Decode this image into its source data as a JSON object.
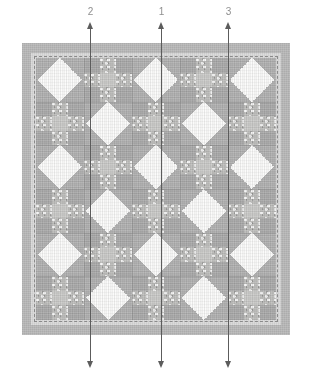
{
  "diagram": {
    "type": "quilt-layout",
    "canvas": {
      "width": 313,
      "height": 371
    }
  },
  "colors": {
    "outer_border": "#b5b5b5",
    "inner_band": "#d7d7d7",
    "field_background": "#f4f4f2",
    "patch_dark": "#a9a9a9",
    "patch_medium": "#c9c9c7",
    "patch_light": "#f6f6f4",
    "patch_texture": "#bdbdbb",
    "arrow": "#5c5c5c",
    "label_text": "#8f8f8f",
    "stitch_line": "#8a8a8a"
  },
  "quilt": {
    "outer_border_label": "outer border",
    "inner_band_label": "inner border",
    "stitch_line_label": "basting stitch line",
    "field_label": "pieced center",
    "grid": {
      "columns": 5,
      "rows": 6
    },
    "block_types": [
      "snowball",
      "nine-patch"
    ],
    "blocks": [
      [
        "snowball",
        "nine-patch",
        "snowball",
        "nine-patch",
        "snowball"
      ],
      [
        "nine-patch",
        "snowball",
        "nine-patch",
        "snowball",
        "nine-patch"
      ],
      [
        "snowball",
        "nine-patch",
        "snowball",
        "nine-patch",
        "snowball"
      ],
      [
        "nine-patch",
        "snowball",
        "nine-patch",
        "snowball",
        "nine-patch"
      ],
      [
        "snowball",
        "nine-patch",
        "snowball",
        "nine-patch",
        "snowball"
      ],
      [
        "nine-patch",
        "snowball",
        "nine-patch",
        "snowball",
        "nine-patch"
      ]
    ],
    "nine_patch_layout": [
      [
        "dark",
        "texture",
        "dark"
      ],
      [
        "texture",
        "medium",
        "texture"
      ],
      [
        "dark",
        "texture",
        "dark"
      ]
    ]
  },
  "arrows": [
    {
      "id": "arrow-2",
      "label": "2",
      "x": 90,
      "top_y": 28,
      "bottom_y": 362
    },
    {
      "id": "arrow-1",
      "label": "1",
      "x": 161,
      "top_y": 28,
      "bottom_y": 362
    },
    {
      "id": "arrow-3",
      "label": "3",
      "x": 228,
      "top_y": 28,
      "bottom_y": 362
    }
  ],
  "labels": {
    "arrow_2": "2",
    "arrow_1": "1",
    "arrow_3": "3"
  }
}
